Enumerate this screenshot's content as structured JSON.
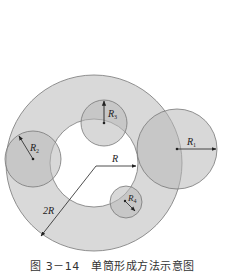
{
  "figure": {
    "caption": "图 3－14　单筒形成方法示意图",
    "colors": {
      "background": "#ffffff",
      "ring_fill": "#d9d9d9",
      "circle_fill": "#b8b8b8",
      "stroke": "#777777",
      "arrow": "#222222"
    },
    "annulus": {
      "center": [
        94,
        163
      ],
      "inner_radius": 44,
      "outer_radius": 88,
      "inner_label": "R",
      "outer_label": "2R"
    },
    "circles": [
      {
        "id": "R1",
        "label": "R",
        "subscript": "1",
        "center": [
          177,
          149
        ],
        "radius": 40
      },
      {
        "id": "R2",
        "label": "R",
        "subscript": "2",
        "center": [
          33,
          159
        ],
        "radius": 28
      },
      {
        "id": "R3",
        "label": "R",
        "subscript": "3",
        "center": [
          104,
          123
        ],
        "radius": 23
      },
      {
        "id": "R4",
        "label": "R",
        "subscript": "4",
        "center": [
          126,
          202
        ],
        "radius": 16
      }
    ]
  }
}
